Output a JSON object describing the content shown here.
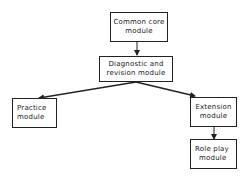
{
  "diagram": {
    "nodes": [
      {
        "id": "common-core",
        "line1": "Common core",
        "line2": "module"
      },
      {
        "id": "diagnostic",
        "line1": "Diagnostic  and",
        "line2": "revision  module"
      },
      {
        "id": "practice",
        "line1": "Practice",
        "line2": "module"
      },
      {
        "id": "extension",
        "line1": "Extension",
        "line2": "module"
      },
      {
        "id": "role-play",
        "line1": "Role  play",
        "line2": "module"
      }
    ],
    "edges": [
      {
        "from": "common-core",
        "to": "diagnostic",
        "type": "arrow"
      },
      {
        "from": "diagnostic",
        "to": "practice",
        "type": "arrow"
      },
      {
        "from": "diagnostic",
        "to": "extension",
        "type": "arrow"
      },
      {
        "from": "extension",
        "to": "role-play",
        "type": "arrow"
      }
    ],
    "colors": {
      "stroke": "#222222",
      "background": "#ffffff",
      "text": "#1a1a1a"
    }
  }
}
